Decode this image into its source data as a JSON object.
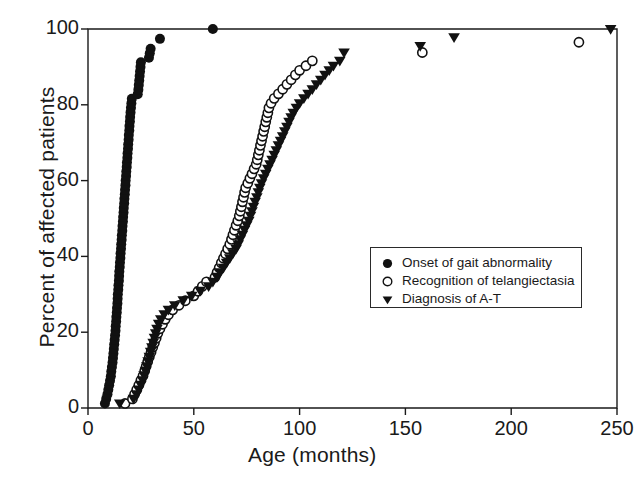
{
  "figure": {
    "background": "#ffffff",
    "ink_color": "#1a1a1a",
    "marker_color": "#111111"
  },
  "axes": {
    "x_title": "Age (months)",
    "y_title": "Percent of affected patients",
    "x_ticks": [
      "0",
      "50",
      "100",
      "150",
      "200",
      "250"
    ],
    "y_ticks": [
      "0",
      "20",
      "40",
      "60",
      "80",
      "100"
    ]
  },
  "legend": {
    "items": [
      {
        "marker": "filled-circle-icon",
        "label": "Onset of gait abnormality"
      },
      {
        "marker": "open-circle-icon",
        "label": "Recognition of telangiectasia"
      },
      {
        "marker": "filled-triangle-down-icon",
        "label": "Diagnosis of A-T"
      }
    ]
  },
  "chart_data": {
    "type": "scatter",
    "title": "",
    "xlabel": "Age (months)",
    "ylabel": "Percent of affected patients",
    "xlim": [
      0,
      250
    ],
    "ylim": [
      0,
      100
    ],
    "xticks": [
      0,
      50,
      100,
      150,
      200,
      250
    ],
    "yticks": [
      0,
      20,
      40,
      60,
      80,
      100
    ],
    "grid": false,
    "legend_position": "center-right",
    "series": [
      {
        "name": "Onset of gait abnormality",
        "marker": "filled-circle",
        "points": [
          [
            8.0,
            1.2
          ],
          [
            8.6,
            2.4
          ],
          [
            9.2,
            3.6
          ],
          [
            9.6,
            4.8
          ],
          [
            10.0,
            6.0
          ],
          [
            10.4,
            7.2
          ],
          [
            10.8,
            8.4
          ],
          [
            11.0,
            9.6
          ],
          [
            11.3,
            10.8
          ],
          [
            11.6,
            12.0
          ],
          [
            11.8,
            13.2
          ],
          [
            12.0,
            14.4
          ],
          [
            12.2,
            15.6
          ],
          [
            12.4,
            16.8
          ],
          [
            12.6,
            18.0
          ],
          [
            12.8,
            19.2
          ],
          [
            13.0,
            20.4
          ],
          [
            13.1,
            21.6
          ],
          [
            13.3,
            22.8
          ],
          [
            13.4,
            24.0
          ],
          [
            13.6,
            25.2
          ],
          [
            13.7,
            26.4
          ],
          [
            13.9,
            27.6
          ],
          [
            14.0,
            28.8
          ],
          [
            14.1,
            30.0
          ],
          [
            14.3,
            31.2
          ],
          [
            14.4,
            32.4
          ],
          [
            14.6,
            33.6
          ],
          [
            14.7,
            34.8
          ],
          [
            14.8,
            36.0
          ],
          [
            15.0,
            37.2
          ],
          [
            15.1,
            38.4
          ],
          [
            15.3,
            39.6
          ],
          [
            15.4,
            40.8
          ],
          [
            15.6,
            42.0
          ],
          [
            15.7,
            43.2
          ],
          [
            15.9,
            44.4
          ],
          [
            16.0,
            45.6
          ],
          [
            16.2,
            46.8
          ],
          [
            16.3,
            48.0
          ],
          [
            16.5,
            49.2
          ],
          [
            16.6,
            50.4
          ],
          [
            16.8,
            51.6
          ],
          [
            16.9,
            52.8
          ],
          [
            17.1,
            54.0
          ],
          [
            17.2,
            55.2
          ],
          [
            17.4,
            56.4
          ],
          [
            17.5,
            57.6
          ],
          [
            17.7,
            58.8
          ],
          [
            17.8,
            60.0
          ],
          [
            18.0,
            61.2
          ],
          [
            18.1,
            62.4
          ],
          [
            18.3,
            63.6
          ],
          [
            18.4,
            64.8
          ],
          [
            18.6,
            66.0
          ],
          [
            18.7,
            67.2
          ],
          [
            18.9,
            68.4
          ],
          [
            19.0,
            69.6
          ],
          [
            19.2,
            70.8
          ],
          [
            19.3,
            72.0
          ],
          [
            19.5,
            73.2
          ],
          [
            19.6,
            74.4
          ],
          [
            19.8,
            75.6
          ],
          [
            19.9,
            76.8
          ],
          [
            20.1,
            78.0
          ],
          [
            20.3,
            79.2
          ],
          [
            20.5,
            80.4
          ],
          [
            20.7,
            81.6
          ],
          [
            23.5,
            82.8
          ],
          [
            23.8,
            84.0
          ],
          [
            24.0,
            85.2
          ],
          [
            24.2,
            86.4
          ],
          [
            24.4,
            87.6
          ],
          [
            24.6,
            88.8
          ],
          [
            24.8,
            90.0
          ],
          [
            25.0,
            91.2
          ],
          [
            28.8,
            92.4
          ],
          [
            29.2,
            93.6
          ],
          [
            29.6,
            94.8
          ],
          [
            34.0,
            97.4
          ],
          [
            59.0,
            100.0
          ]
        ]
      },
      {
        "name": "Recognition of telangiectasia",
        "marker": "open-circle",
        "points": [
          [
            17.5,
            1.2
          ],
          [
            21.0,
            2.4
          ],
          [
            22.0,
            3.6
          ],
          [
            23.0,
            4.8
          ],
          [
            24.0,
            6.0
          ],
          [
            25.0,
            7.3
          ],
          [
            26.0,
            8.5
          ],
          [
            26.8,
            9.8
          ],
          [
            27.5,
            11.0
          ],
          [
            28.2,
            12.2
          ],
          [
            29.0,
            13.5
          ],
          [
            29.8,
            14.7
          ],
          [
            30.6,
            16.0
          ],
          [
            31.4,
            17.2
          ],
          [
            32.2,
            18.4
          ],
          [
            33.0,
            19.7
          ],
          [
            34.0,
            20.9
          ],
          [
            35.2,
            22.1
          ],
          [
            36.5,
            23.4
          ],
          [
            38.0,
            24.6
          ],
          [
            40.0,
            25.9
          ],
          [
            43.0,
            27.1
          ],
          [
            46.0,
            28.3
          ],
          [
            50.0,
            29.6
          ],
          [
            52.0,
            30.8
          ],
          [
            54.0,
            32.1
          ],
          [
            56.0,
            33.3
          ],
          [
            60.0,
            34.5
          ],
          [
            61.0,
            35.8
          ],
          [
            62.0,
            37.0
          ],
          [
            63.0,
            38.3
          ],
          [
            64.0,
            39.5
          ],
          [
            65.0,
            40.7
          ],
          [
            66.0,
            42.0
          ],
          [
            67.0,
            43.2
          ],
          [
            67.8,
            44.5
          ],
          [
            68.5,
            45.7
          ],
          [
            69.2,
            46.9
          ],
          [
            70.0,
            48.2
          ],
          [
            70.8,
            49.4
          ],
          [
            71.5,
            50.7
          ],
          [
            72.0,
            51.9
          ],
          [
            72.5,
            53.1
          ],
          [
            73.0,
            54.4
          ],
          [
            73.5,
            55.6
          ],
          [
            74.0,
            56.9
          ],
          [
            74.5,
            58.1
          ],
          [
            75.5,
            59.3
          ],
          [
            76.5,
            60.6
          ],
          [
            77.5,
            61.8
          ],
          [
            78.5,
            63.1
          ],
          [
            79.5,
            64.3
          ],
          [
            80.0,
            65.5
          ],
          [
            80.5,
            66.8
          ],
          [
            81.0,
            68.0
          ],
          [
            81.5,
            69.3
          ],
          [
            82.0,
            70.5
          ],
          [
            82.5,
            71.7
          ],
          [
            83.0,
            73.0
          ],
          [
            83.5,
            74.2
          ],
          [
            84.0,
            75.5
          ],
          [
            84.5,
            76.7
          ],
          [
            85.0,
            77.9
          ],
          [
            85.5,
            79.2
          ],
          [
            86.5,
            80.4
          ],
          [
            88.0,
            81.7
          ],
          [
            90.0,
            82.9
          ],
          [
            92.0,
            84.1
          ],
          [
            94.0,
            85.4
          ],
          [
            96.0,
            86.6
          ],
          [
            98.0,
            87.9
          ],
          [
            100.0,
            89.1
          ],
          [
            103.0,
            90.3
          ],
          [
            106.0,
            91.6
          ],
          [
            158.0,
            93.8
          ],
          [
            232.0,
            96.5
          ]
        ]
      },
      {
        "name": "Diagnosis of A-T",
        "marker": "filled-triangle-down",
        "points": [
          [
            15.0,
            1.2
          ],
          [
            21.5,
            2.4
          ],
          [
            23.0,
            3.6
          ],
          [
            24.0,
            4.9
          ],
          [
            25.0,
            6.1
          ],
          [
            25.8,
            7.3
          ],
          [
            26.5,
            8.6
          ],
          [
            27.2,
            9.8
          ],
          [
            27.8,
            11.0
          ],
          [
            28.4,
            12.3
          ],
          [
            29.0,
            13.5
          ],
          [
            29.6,
            14.8
          ],
          [
            30.2,
            16.0
          ],
          [
            30.8,
            17.2
          ],
          [
            31.4,
            18.5
          ],
          [
            32.0,
            19.7
          ],
          [
            32.6,
            20.9
          ],
          [
            33.4,
            22.2
          ],
          [
            34.4,
            23.4
          ],
          [
            36.0,
            24.7
          ],
          [
            38.0,
            25.9
          ],
          [
            41.0,
            27.1
          ],
          [
            45.0,
            28.4
          ],
          [
            49.0,
            29.6
          ],
          [
            53.0,
            30.9
          ],
          [
            57.0,
            32.1
          ],
          [
            59.0,
            33.3
          ],
          [
            61.0,
            34.6
          ],
          [
            62.5,
            35.8
          ],
          [
            64.0,
            37.0
          ],
          [
            65.5,
            38.3
          ],
          [
            67.0,
            39.5
          ],
          [
            68.5,
            40.8
          ],
          [
            70.0,
            42.0
          ],
          [
            71.0,
            43.2
          ],
          [
            72.0,
            44.5
          ],
          [
            73.0,
            45.7
          ],
          [
            74.0,
            47.0
          ],
          [
            75.0,
            48.2
          ],
          [
            76.0,
            49.4
          ],
          [
            76.8,
            50.7
          ],
          [
            77.5,
            51.9
          ],
          [
            78.2,
            53.1
          ],
          [
            79.0,
            54.4
          ],
          [
            79.8,
            55.6
          ],
          [
            80.5,
            56.9
          ],
          [
            81.2,
            58.1
          ],
          [
            82.0,
            59.3
          ],
          [
            83.0,
            60.6
          ],
          [
            84.0,
            61.8
          ],
          [
            85.0,
            63.1
          ],
          [
            86.0,
            64.3
          ],
          [
            87.0,
            65.5
          ],
          [
            88.0,
            66.8
          ],
          [
            89.0,
            68.0
          ],
          [
            90.0,
            69.3
          ],
          [
            91.0,
            70.5
          ],
          [
            92.0,
            71.7
          ],
          [
            93.0,
            73.0
          ],
          [
            94.0,
            74.2
          ],
          [
            95.0,
            75.5
          ],
          [
            96.0,
            76.7
          ],
          [
            97.0,
            77.9
          ],
          [
            98.5,
            79.2
          ],
          [
            100.0,
            80.4
          ],
          [
            102.0,
            81.7
          ],
          [
            104.0,
            82.9
          ],
          [
            106.0,
            84.1
          ],
          [
            108.0,
            85.4
          ],
          [
            110.0,
            86.6
          ],
          [
            112.0,
            87.9
          ],
          [
            114.0,
            89.1
          ],
          [
            116.0,
            90.3
          ],
          [
            119.0,
            91.6
          ],
          [
            121.0,
            93.8
          ],
          [
            157.0,
            95.5
          ],
          [
            173.0,
            97.8
          ],
          [
            247.0,
            100.0
          ]
        ]
      }
    ]
  }
}
